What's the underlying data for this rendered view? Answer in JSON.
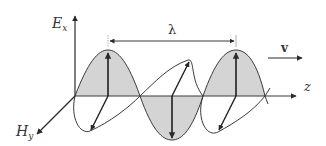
{
  "diagram": {
    "labels": {
      "e_axis": "E",
      "e_axis_sub": "x",
      "h_axis": "H",
      "h_axis_sub": "y",
      "z_axis": "z",
      "wavelength": "λ",
      "velocity": "v"
    },
    "colors": {
      "line": "#3a3a3a",
      "fill": "#d4d4d4",
      "background": "#ffffff"
    }
  }
}
